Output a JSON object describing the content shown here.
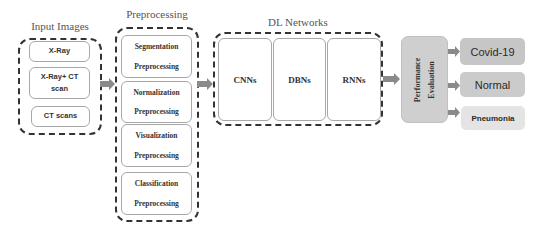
{
  "diagram": {
    "input_images": {
      "title": "Input Images",
      "items": [
        "X-Ray",
        "X-Ray+ CT scan",
        "CT scans"
      ]
    },
    "preprocessing": {
      "title": "Preprocessing",
      "items": [
        {
          "line1": "Segmentation",
          "line2": "Preprocessing"
        },
        {
          "line1": "Normalization",
          "line2": "Preprocessing"
        },
        {
          "line1": "Visualization",
          "line2": "Preprocessing"
        },
        {
          "line1": "Classification",
          "line2": "Preprocessing"
        }
      ]
    },
    "dl_networks": {
      "title": "DL Networks",
      "items": [
        "CNNs",
        "DBNs",
        "RNNs"
      ]
    },
    "performance_evaluation": {
      "line1": "Performance",
      "line2": "Evaluation"
    },
    "outputs": [
      {
        "label": "Covid-19",
        "color": "#c6c6c6"
      },
      {
        "label": "Normal",
        "color": "#cbcbcb"
      },
      {
        "label": "Pneumonia",
        "color": "#e4e4e4"
      }
    ],
    "colors": {
      "arrow": "#8a8a8a",
      "dashed_border": "#333333",
      "perf_box": "#cfcfcf"
    }
  }
}
